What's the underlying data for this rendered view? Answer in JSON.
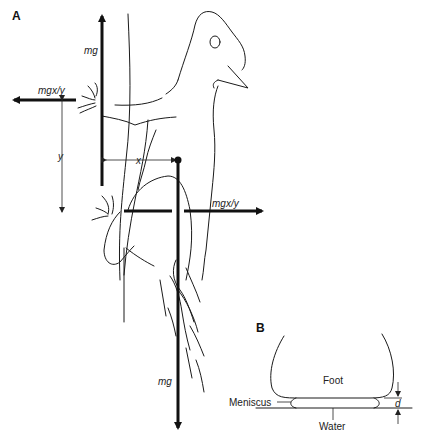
{
  "figure": {
    "panel_a": {
      "label": "A",
      "subject": "gecko clinging to vertical surface",
      "labels": {
        "mg_up": "mg",
        "mgxy_left": "mgx/y",
        "y_dim": "y",
        "x_dim": "x",
        "mgxy_right": "mgx/y",
        "mg_down": "mg"
      }
    },
    "panel_b": {
      "label": "B",
      "labels": {
        "foot": "Foot",
        "meniscus": "Meniscus",
        "water": "Water",
        "d_dim": "d"
      }
    },
    "colors": {
      "background": "#ffffff",
      "ink": "#111111"
    }
  }
}
